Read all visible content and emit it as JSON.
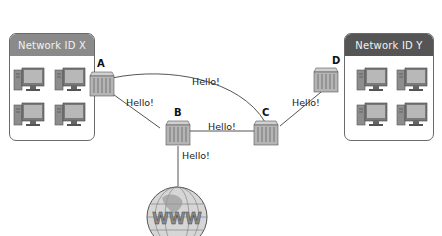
{
  "diagram": {
    "type": "network-topology",
    "networks": [
      {
        "id": "net-x",
        "title": "Network ID X",
        "header_color": "#8a8a8a",
        "computers": 4
      },
      {
        "id": "net-y",
        "title": "Network ID Y",
        "header_color": "#555555",
        "computers": 4
      }
    ],
    "routers": [
      {
        "id": "A",
        "label": "A"
      },
      {
        "id": "B",
        "label": "B"
      },
      {
        "id": "C",
        "label": "C"
      },
      {
        "id": "D",
        "label": "D"
      }
    ],
    "links": [
      {
        "from": "A",
        "to": "C",
        "label": "Hello!"
      },
      {
        "from": "A",
        "to": "B",
        "label": "Hello!"
      },
      {
        "from": "B",
        "to": "C",
        "label": "Hello!"
      },
      {
        "from": "C",
        "to": "D",
        "label": "Hello!"
      },
      {
        "from": "B",
        "to": "WWW",
        "label": "Hello!"
      }
    ],
    "internet": {
      "label": "WWW"
    }
  }
}
